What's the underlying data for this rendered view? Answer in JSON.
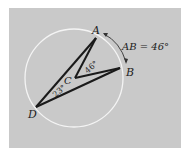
{
  "figure": {
    "points": {
      "A": {
        "label": "A",
        "x": 96,
        "y": 38
      },
      "B": {
        "label": "B",
        "x": 121,
        "y": 68
      },
      "C": {
        "label": "C",
        "x": 75,
        "y": 78
      },
      "D": {
        "label": "D",
        "x": 37,
        "y": 107
      }
    },
    "circle": {
      "cx": 75,
      "cy": 78,
      "r": 50,
      "color": "#f4f4f4"
    },
    "angle_labels": {
      "central": "46°",
      "inscribed": "23°"
    },
    "arc_label": "AB = 46°",
    "colors": {
      "background": "#c9c9c9",
      "lines": "#1a1a1a",
      "text": "#222222"
    }
  }
}
